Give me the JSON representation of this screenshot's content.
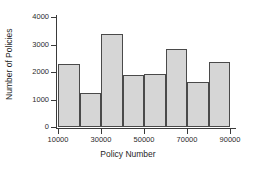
{
  "chart_data": {
    "type": "bar",
    "title": "",
    "xlabel": "Policy Number",
    "ylabel": "Number of Policies",
    "grid": false,
    "legend": false,
    "bin_width": 10000,
    "bin_edges": [
      10000,
      20000,
      30000,
      40000,
      50000,
      60000,
      70000,
      80000,
      90000
    ],
    "categories": [
      "10000-20000",
      "20000-30000",
      "30000-40000",
      "40000-50000",
      "50000-60000",
      "60000-70000",
      "70000-80000",
      "80000-90000"
    ],
    "values": [
      2290,
      1240,
      3390,
      1890,
      1920,
      2840,
      1650,
      2360
    ],
    "xlim": [
      10000,
      90000
    ],
    "ylim": [
      0,
      4000
    ],
    "xticks": [
      10000,
      30000,
      50000,
      70000,
      90000
    ],
    "xtick_labels": [
      "10000",
      "30000",
      "50000",
      "70000",
      "90000"
    ],
    "yticks": [
      0,
      1000,
      2000,
      3000,
      4000
    ],
    "ytick_labels": [
      "0",
      "1000",
      "2000",
      "3000",
      "4000"
    ],
    "bar_fill_color": "#d6d6d6",
    "bar_edge_color": "#4a4a4a",
    "axis_color": "#3a3a3a",
    "background_color": "#ffffff"
  }
}
